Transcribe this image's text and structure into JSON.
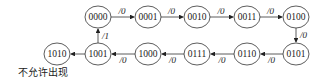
{
  "diagram": {
    "type": "state-transition",
    "states": [
      {
        "id": "s0000",
        "label": "0000",
        "x": 98,
        "y": 17
      },
      {
        "id": "s0001",
        "label": "0001",
        "x": 148,
        "y": 17
      },
      {
        "id": "s0010",
        "label": "0010",
        "x": 197,
        "y": 17
      },
      {
        "id": "s0011",
        "label": "0011",
        "x": 247,
        "y": 17
      },
      {
        "id": "s0100",
        "label": "0100",
        "x": 296,
        "y": 17
      },
      {
        "id": "s0101",
        "label": "0101",
        "x": 296,
        "y": 54
      },
      {
        "id": "s0110",
        "label": "0110",
        "x": 247,
        "y": 54
      },
      {
        "id": "s0111",
        "label": "0111",
        "x": 197,
        "y": 54
      },
      {
        "id": "s1000",
        "label": "1000",
        "x": 148,
        "y": 54
      },
      {
        "id": "s1001",
        "label": "1001",
        "x": 98,
        "y": 54
      },
      {
        "id": "s1010",
        "label": "1010",
        "x": 57,
        "y": 54
      }
    ],
    "transitions": [
      {
        "from": "0000",
        "to": "0001",
        "label": "/0"
      },
      {
        "from": "0001",
        "to": "0010",
        "label": "/0"
      },
      {
        "from": "0010",
        "to": "0011",
        "label": "/0"
      },
      {
        "from": "0011",
        "to": "0100",
        "label": "/0"
      },
      {
        "from": "0100",
        "to": "0101",
        "label": "/0"
      },
      {
        "from": "0101",
        "to": "0110",
        "label": "/0"
      },
      {
        "from": "0110",
        "to": "0111",
        "label": "/0"
      },
      {
        "from": "0111",
        "to": "1000",
        "label": "/0"
      },
      {
        "from": "1000",
        "to": "1001",
        "label": "/0"
      },
      {
        "from": "1001",
        "to": "0000",
        "label": "/1"
      },
      {
        "from": "1001",
        "to": "1010",
        "label": ""
      }
    ],
    "note": "不允许出现"
  }
}
